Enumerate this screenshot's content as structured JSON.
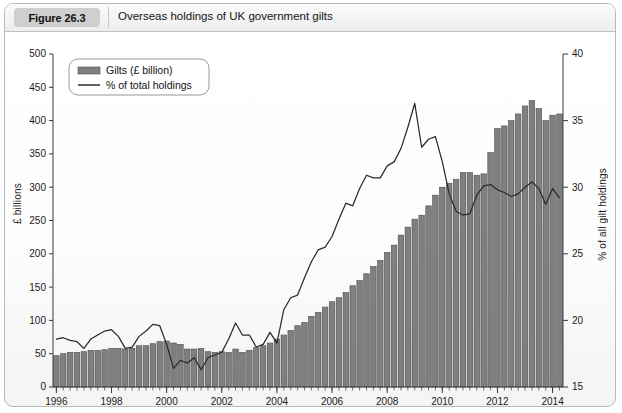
{
  "header": {
    "figure_label": "Figure 26.3",
    "title": "Overseas holdings of UK government gilts"
  },
  "chart_data": {
    "type": "bar",
    "title": "Overseas holdings of UK government gilts",
    "xlabel": "",
    "ylabel": "£ billions",
    "y2label": "% of all gilt holdings",
    "grid": false,
    "legend_position": "top-left",
    "xlim": [
      1996,
      2014.5
    ],
    "ylim": [
      0,
      500
    ],
    "y2lim": [
      15,
      40
    ],
    "yticks": [
      0,
      50,
      100,
      150,
      200,
      250,
      300,
      350,
      400,
      450,
      500
    ],
    "y2ticks": [
      15,
      20,
      25,
      30,
      35,
      40
    ],
    "xticks": [
      1996,
      1998,
      2000,
      2002,
      2004,
      2006,
      2008,
      2010,
      2012,
      2014
    ],
    "xtick_labels": [
      "1996",
      "1998",
      "2000",
      "2002",
      "2004",
      "2006",
      "2008",
      "2010",
      "2012",
      "2014"
    ],
    "ytick_labels": [
      "0",
      "50",
      "100",
      "150",
      "200",
      "250",
      "300",
      "350",
      "400",
      "450",
      "500"
    ],
    "y2tick_labels": [
      "15",
      "20",
      "25",
      "30",
      "35",
      "40"
    ],
    "legend": [
      {
        "label": "Gilts (£ billion)",
        "type": "bar",
        "color": "#807f7f"
      },
      {
        "label": "% of total holdings",
        "type": "line",
        "color": "#2b2b2b"
      }
    ],
    "x": [
      1996.0,
      1996.25,
      1996.5,
      1996.75,
      1997.0,
      1997.25,
      1997.5,
      1997.75,
      1998.0,
      1998.25,
      1998.5,
      1998.75,
      1999.0,
      1999.25,
      1999.5,
      1999.75,
      2000.0,
      2000.25,
      2000.5,
      2000.75,
      2001.0,
      2001.25,
      2001.5,
      2001.75,
      2002.0,
      2002.25,
      2002.5,
      2002.75,
      2003.0,
      2003.25,
      2003.5,
      2003.75,
      2004.0,
      2004.25,
      2004.5,
      2004.75,
      2005.0,
      2005.25,
      2005.5,
      2005.75,
      2006.0,
      2006.25,
      2006.5,
      2006.75,
      2007.0,
      2007.25,
      2007.5,
      2007.75,
      2008.0,
      2008.25,
      2008.5,
      2008.75,
      2009.0,
      2009.25,
      2009.5,
      2009.75,
      2010.0,
      2010.25,
      2010.5,
      2010.75,
      2011.0,
      2011.25,
      2011.5,
      2011.75,
      2012.0,
      2012.25,
      2012.5,
      2012.75,
      2013.0,
      2013.25,
      2013.5,
      2013.75,
      2014.0,
      2014.25
    ],
    "series": [
      {
        "name": "Gilts (£ billion)",
        "axis": "left",
        "type": "bar",
        "unit": "£ billion",
        "values": [
          47,
          50,
          52,
          52,
          53,
          55,
          55,
          56,
          58,
          58,
          57,
          58,
          62,
          62,
          65,
          68,
          69,
          66,
          64,
          57,
          57,
          58,
          53,
          52,
          53,
          52,
          57,
          52,
          55,
          59,
          62,
          66,
          72,
          78,
          85,
          92,
          97,
          106,
          112,
          120,
          128,
          134,
          142,
          152,
          160,
          170,
          181,
          190,
          202,
          213,
          228,
          240,
          252,
          258,
          272,
          288,
          300,
          306,
          312,
          322,
          322,
          318,
          320,
          352,
          388,
          392,
          400,
          410,
          422,
          430,
          418,
          400,
          408,
          410
        ]
      },
      {
        "name": "% of total holdings",
        "axis": "right",
        "type": "line",
        "unit": "%",
        "values": [
          18.6,
          18.7,
          18.5,
          18.4,
          17.9,
          18.6,
          18.9,
          19.2,
          19.3,
          18.8,
          17.9,
          18.0,
          18.8,
          19.2,
          19.7,
          19.6,
          18.2,
          16.4,
          17.0,
          16.8,
          17.2,
          16.3,
          17.2,
          17.4,
          17.6,
          18.6,
          19.8,
          18.9,
          18.9,
          18.0,
          18.2,
          19.1,
          18.3,
          20.8,
          21.7,
          21.9,
          23.2,
          24.4,
          25.3,
          25.5,
          26.3,
          27.6,
          28.8,
          28.6,
          29.9,
          30.9,
          30.7,
          30.7,
          31.6,
          31.9,
          32.9,
          34.5,
          36.3,
          33.0,
          33.6,
          33.8,
          31.9,
          29.5,
          28.2,
          27.9,
          28.0,
          29.4,
          30.1,
          30.2,
          29.8,
          29.6,
          29.3,
          29.5,
          30.0,
          30.4,
          29.9,
          28.7,
          29.9,
          29.2
        ]
      }
    ]
  },
  "icons": {
    "legend_bar_swatch": "bar-swatch-icon",
    "legend_line_swatch": "line-swatch-icon"
  }
}
